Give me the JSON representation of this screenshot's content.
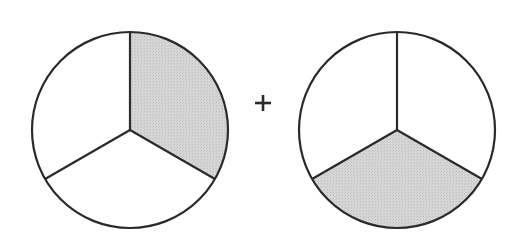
{
  "diagram": {
    "operator": "+",
    "colors": {
      "stroke": "#2a2a2a",
      "shaded": "#d4d4d4",
      "unshaded": "#ffffff"
    },
    "circles": [
      {
        "name": "left-pie",
        "cx": 130,
        "cy": 130,
        "r": 98,
        "parts": 3,
        "shaded_part": "upper-right"
      },
      {
        "name": "right-pie",
        "cx": 397,
        "cy": 130,
        "r": 98,
        "parts": 3,
        "shaded_part": "bottom"
      }
    ]
  }
}
